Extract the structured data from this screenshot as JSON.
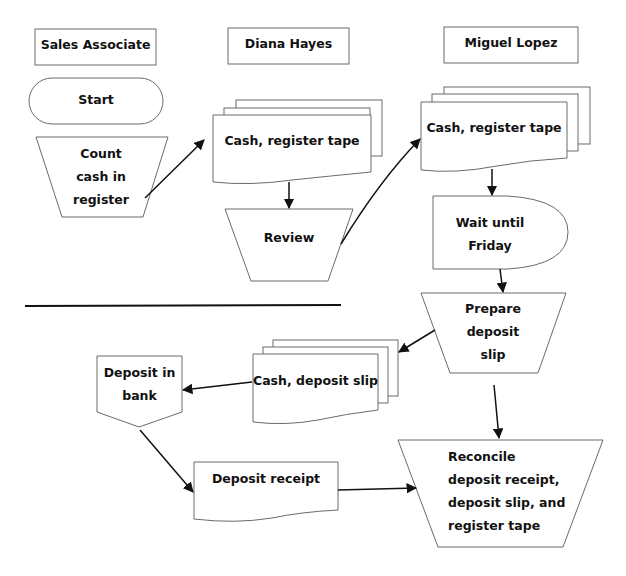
{
  "diagram": {
    "type": "flowchart",
    "swimlanes": [
      {
        "id": "sales-associate",
        "label": "Sales Associate"
      },
      {
        "id": "diana-hayes",
        "label": "Diana Hayes"
      },
      {
        "id": "miguel-lopez",
        "label": "Miguel Lopez"
      }
    ],
    "nodes": [
      {
        "id": "start",
        "shape": "terminator",
        "lines": [
          "Start"
        ]
      },
      {
        "id": "count-cash",
        "shape": "manual-operation",
        "lines": [
          "Count",
          "cash in",
          "register"
        ]
      },
      {
        "id": "docs-diana",
        "shape": "multi-document",
        "lines": [
          "Cash, register tape"
        ]
      },
      {
        "id": "review",
        "shape": "manual-operation",
        "lines": [
          "Review"
        ]
      },
      {
        "id": "docs-miguel",
        "shape": "multi-document",
        "lines": [
          "Cash, register tape"
        ]
      },
      {
        "id": "wait",
        "shape": "delay",
        "lines": [
          "Wait until",
          "Friday"
        ]
      },
      {
        "id": "prepare-slip",
        "shape": "manual-operation",
        "lines": [
          "Prepare",
          "deposit",
          "slip"
        ]
      },
      {
        "id": "docs-deposit",
        "shape": "multi-document",
        "lines": [
          "Cash, deposit slip"
        ]
      },
      {
        "id": "deposit-bank",
        "shape": "off-page-connector",
        "lines": [
          "Deposit in",
          "bank"
        ]
      },
      {
        "id": "deposit-receipt",
        "shape": "document",
        "lines": [
          "Deposit receipt"
        ]
      },
      {
        "id": "reconcile",
        "shape": "manual-operation",
        "lines": [
          "Reconcile",
          "deposit receipt,",
          "deposit slip, and",
          "register tape"
        ]
      }
    ],
    "edges": [
      {
        "from": "count-cash",
        "to": "docs-diana"
      },
      {
        "from": "docs-diana",
        "to": "review"
      },
      {
        "from": "review",
        "to": "docs-miguel"
      },
      {
        "from": "docs-miguel",
        "to": "wait"
      },
      {
        "from": "wait",
        "to": "prepare-slip"
      },
      {
        "from": "prepare-slip",
        "to": "docs-deposit"
      },
      {
        "from": "docs-deposit",
        "to": "deposit-bank"
      },
      {
        "from": "deposit-bank",
        "to": "deposit-receipt"
      },
      {
        "from": "deposit-receipt",
        "to": "reconcile"
      },
      {
        "from": "prepare-slip",
        "to": "reconcile"
      }
    ]
  },
  "labels": {
    "lane_sales": "Sales Associate",
    "lane_diana": "Diana Hayes",
    "lane_miguel": "Miguel Lopez",
    "start": "Start",
    "count_1": "Count",
    "count_2": "cash in",
    "count_3": "register",
    "docs_diana": "Cash, register tape",
    "review": "Review",
    "docs_miguel": "Cash, register tape",
    "wait_1": "Wait until",
    "wait_2": "Friday",
    "prepare_1": "Prepare",
    "prepare_2": "deposit",
    "prepare_3": "slip",
    "docs_deposit": "Cash, deposit slip",
    "bank_1": "Deposit in",
    "bank_2": "bank",
    "receipt": "Deposit receipt",
    "reconcile_1": "Reconcile",
    "reconcile_2": "deposit receipt,",
    "reconcile_3": "deposit slip, and",
    "reconcile_4": "register tape"
  }
}
